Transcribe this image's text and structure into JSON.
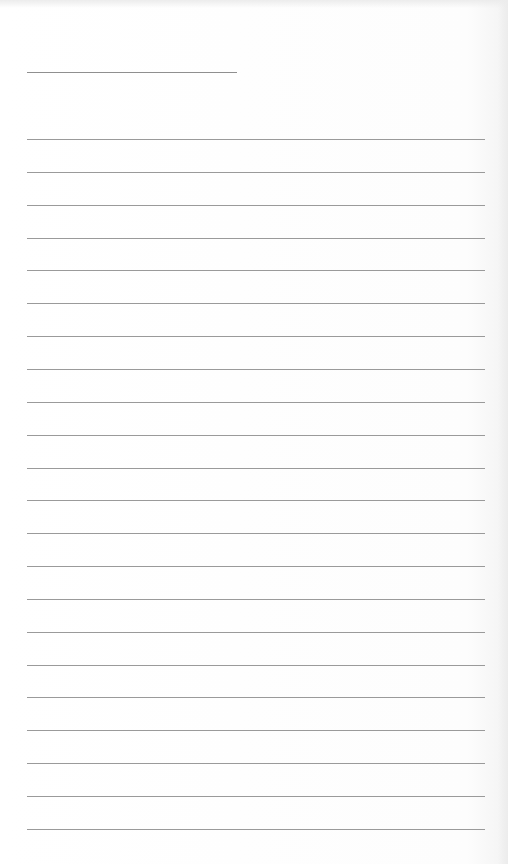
{
  "page": {
    "type": "lined-paper",
    "header_line": {
      "left": 27,
      "top": 72,
      "width": 210
    },
    "rules": {
      "count": 22,
      "first_top": 139,
      "spacing": 32.85,
      "left": 27,
      "width": 458
    },
    "colors": {
      "paper": "#ffffff",
      "rule": "#9a9a9a"
    }
  }
}
